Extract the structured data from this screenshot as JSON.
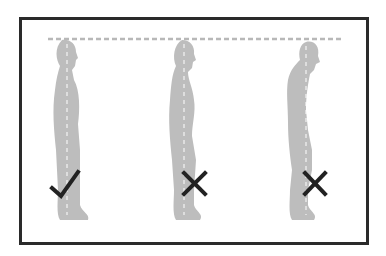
{
  "diagram": {
    "type": "posture-comparison",
    "reference_line": {
      "style": "dashed",
      "color": "#b8b8b8",
      "label": ""
    },
    "figure_color": "#bdbdbd",
    "spine_line_color": "#ffffff",
    "mark_color": "#222222",
    "figures": [
      {
        "id": "correct",
        "posture": "upright",
        "mark": "check",
        "mark_glyph": "✓"
      },
      {
        "id": "incorrect-1",
        "posture": "slouched-forward-head",
        "mark": "cross",
        "mark_glyph": "✕"
      },
      {
        "id": "incorrect-2",
        "posture": "hunched-leaning",
        "mark": "cross",
        "mark_glyph": "✕"
      }
    ]
  }
}
